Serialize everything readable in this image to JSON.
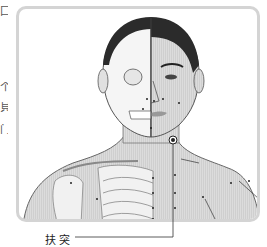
{
  "figure": {
    "caption": "扶突",
    "left_edge_chars": [
      "囗",
      "个",
      "貝",
      "门"
    ],
    "colors": {
      "frame_border": "#d4d4d4",
      "hair": "#2b2b2b",
      "skin": "#d9d9d9",
      "bone": "#f4f4f4",
      "line": "#333333",
      "point": "#222222"
    },
    "points": [
      {
        "name": "futu",
        "x": 173,
        "y": 140,
        "highlighted": true
      }
    ]
  }
}
